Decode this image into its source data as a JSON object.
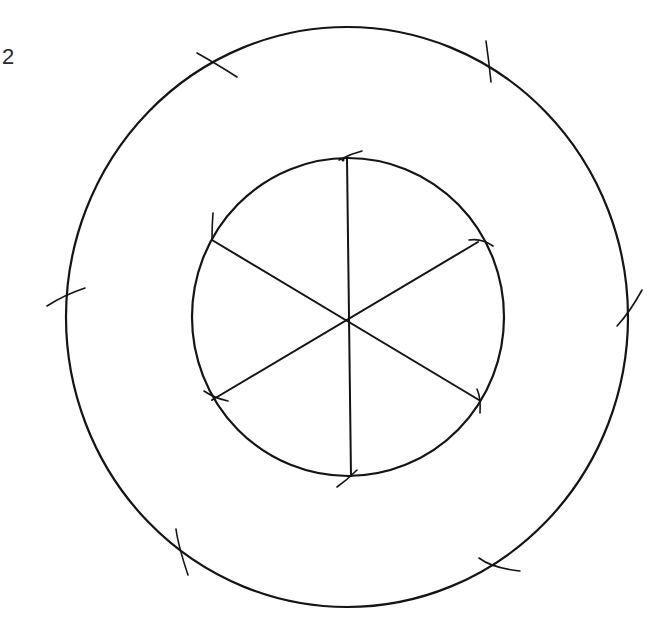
{
  "figure": {
    "label": "2",
    "stroke_color": "#141414",
    "background": "#ffffff"
  },
  "outer_circle": {
    "cx": 347,
    "cy": 317,
    "rx": 281,
    "ry": 290
  },
  "inner_circle": {
    "cx": 348,
    "cy": 317,
    "rx": 156,
    "ry": 159
  },
  "center": {
    "x": 349,
    "y": 318
  },
  "hexagon_vertices": [
    {
      "name": "top",
      "x": 347,
      "y": 158
    },
    {
      "name": "top-right",
      "x": 478,
      "y": 242
    },
    {
      "name": "bottom-right",
      "x": 479,
      "y": 400
    },
    {
      "name": "bottom",
      "x": 351,
      "y": 476
    },
    {
      "name": "bottom-left",
      "x": 212,
      "y": 400
    },
    {
      "name": "top-left",
      "x": 212,
      "y": 240
    }
  ],
  "outer_marks": [
    {
      "x": 214,
      "y": 62
    },
    {
      "x": 489,
      "y": 66
    },
    {
      "x": 66,
      "y": 296
    },
    {
      "x": 627,
      "y": 314
    },
    {
      "x": 180,
      "y": 550
    },
    {
      "x": 493,
      "y": 566
    }
  ]
}
